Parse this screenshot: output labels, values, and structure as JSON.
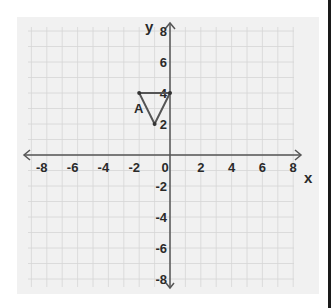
{
  "diagram": {
    "type": "coordinate-plane",
    "x_axis": {
      "label": "x",
      "min": -8,
      "max": 8,
      "ticks": [
        "-8",
        "-6",
        "-4",
        "-2",
        "0",
        "2",
        "4",
        "6",
        "8"
      ]
    },
    "y_axis": {
      "label": "y",
      "min": -8,
      "max": 8,
      "ticks_positive": [
        "2",
        "4",
        "6",
        "8"
      ],
      "ticks_negative": [
        "-2",
        "-4",
        "-6",
        "-8"
      ]
    },
    "shape": {
      "name": "A",
      "label": "A",
      "type": "triangle",
      "vertices": [
        [
          -2,
          4
        ],
        [
          0,
          4
        ],
        [
          -1,
          2
        ]
      ],
      "color": "#555555"
    },
    "colors": {
      "background": "#f1f1f1",
      "grid": "#d6d6d6",
      "axis": "#555555",
      "text": "#2a2a2a",
      "border": "#1a1a1a"
    }
  }
}
